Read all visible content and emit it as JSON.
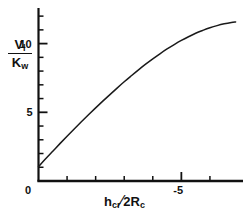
{
  "figure": {
    "background_color": "#ffffff",
    "line_color": "#1a1a1a",
    "axis_color": "#111111",
    "width": 247,
    "height": 215
  },
  "axes": {
    "y": {
      "label_numerator": "V",
      "label_numerator_sub": "l",
      "label_denominator": "K",
      "label_denominator_sub": "w",
      "tick_labels": [
        "0",
        "5",
        "10"
      ],
      "tick_values": [
        0,
        5,
        10
      ]
    },
    "x": {
      "label_first": "h",
      "label_first_sub": "cr",
      "label_slash": "⁄",
      "label_second": "2R",
      "label_second_sub": "c",
      "tick_labels": [
        "0",
        "-5"
      ],
      "tick_values": [
        0,
        -5
      ]
    }
  },
  "chart_data": {
    "type": "line",
    "title": "",
    "xlabel": "h_cr / 2R_c",
    "ylabel": "V_l / K_w",
    "xlim": [
      0,
      -7.0
    ],
    "ylim": [
      0,
      12.3
    ],
    "grid": false,
    "legend": "none",
    "x_tick_labels": [
      "0",
      "-5"
    ],
    "x_tick_values": [
      0,
      -5
    ],
    "y_tick_labels": [
      "0",
      "5",
      "10"
    ],
    "y_tick_values": [
      0,
      5,
      10
    ],
    "x_minor_tick_values": [
      -1,
      -2,
      -3,
      -4,
      -6
    ],
    "y_minor_tick_values": [
      1,
      2,
      3,
      4,
      6,
      7,
      8,
      9,
      11,
      12
    ],
    "series": [
      {
        "name": "V_l/K_w curve",
        "x": [
          0.0,
          -0.25,
          -0.5,
          -0.75,
          -1.0,
          -1.25,
          -1.5,
          -1.75,
          -2.0,
          -2.25,
          -2.5,
          -2.75,
          -3.0,
          -3.25,
          -3.5,
          -3.75,
          -4.0,
          -4.25,
          -4.5,
          -4.75,
          -5.0,
          -5.25,
          -5.5,
          -5.75,
          -6.0,
          -6.25,
          -6.5,
          -6.75,
          -6.9
        ],
        "y": [
          1.05,
          1.62,
          2.17,
          2.72,
          3.26,
          3.79,
          4.31,
          4.82,
          5.32,
          5.81,
          6.29,
          6.76,
          7.22,
          7.66,
          8.09,
          8.5,
          8.89,
          9.26,
          9.61,
          9.93,
          10.23,
          10.5,
          10.75,
          10.96,
          11.15,
          11.31,
          11.44,
          11.54,
          11.58
        ]
      }
    ]
  }
}
